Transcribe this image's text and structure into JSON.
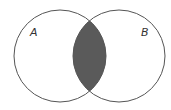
{
  "diagram": {
    "type": "venn",
    "sets": [
      {
        "label": "A",
        "cx": 60,
        "cy": 56,
        "r": 46
      },
      {
        "label": "B",
        "cx": 119,
        "cy": 56,
        "r": 46
      }
    ],
    "shaded_region": "A ∩ B",
    "colors": {
      "outline": "#555555",
      "shade": "#5a5a5a",
      "background": "#ffffff"
    }
  }
}
